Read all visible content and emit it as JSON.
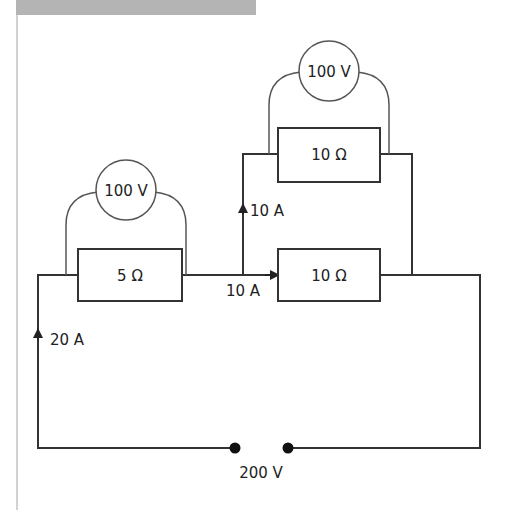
{
  "diagram": {
    "type": "circuit",
    "source": {
      "label": "200 V"
    },
    "resistors": [
      {
        "id": "r1",
        "label": "5 Ω"
      },
      {
        "id": "r2",
        "label": "10 Ω"
      },
      {
        "id": "r3",
        "label": "10 Ω"
      }
    ],
    "voltmeters": [
      {
        "id": "v1",
        "label": "100 V",
        "across": "r1"
      },
      {
        "id": "v2",
        "label": "100 V",
        "across": "r2"
      }
    ],
    "currents": [
      {
        "id": "i_main",
        "label": "20 A"
      },
      {
        "id": "i_upper",
        "label": "10 A"
      },
      {
        "id": "i_lower",
        "label": "10 A"
      }
    ]
  },
  "colors": {
    "wire": "#333333",
    "meter": "#555555",
    "header": "#b4b4b4"
  }
}
